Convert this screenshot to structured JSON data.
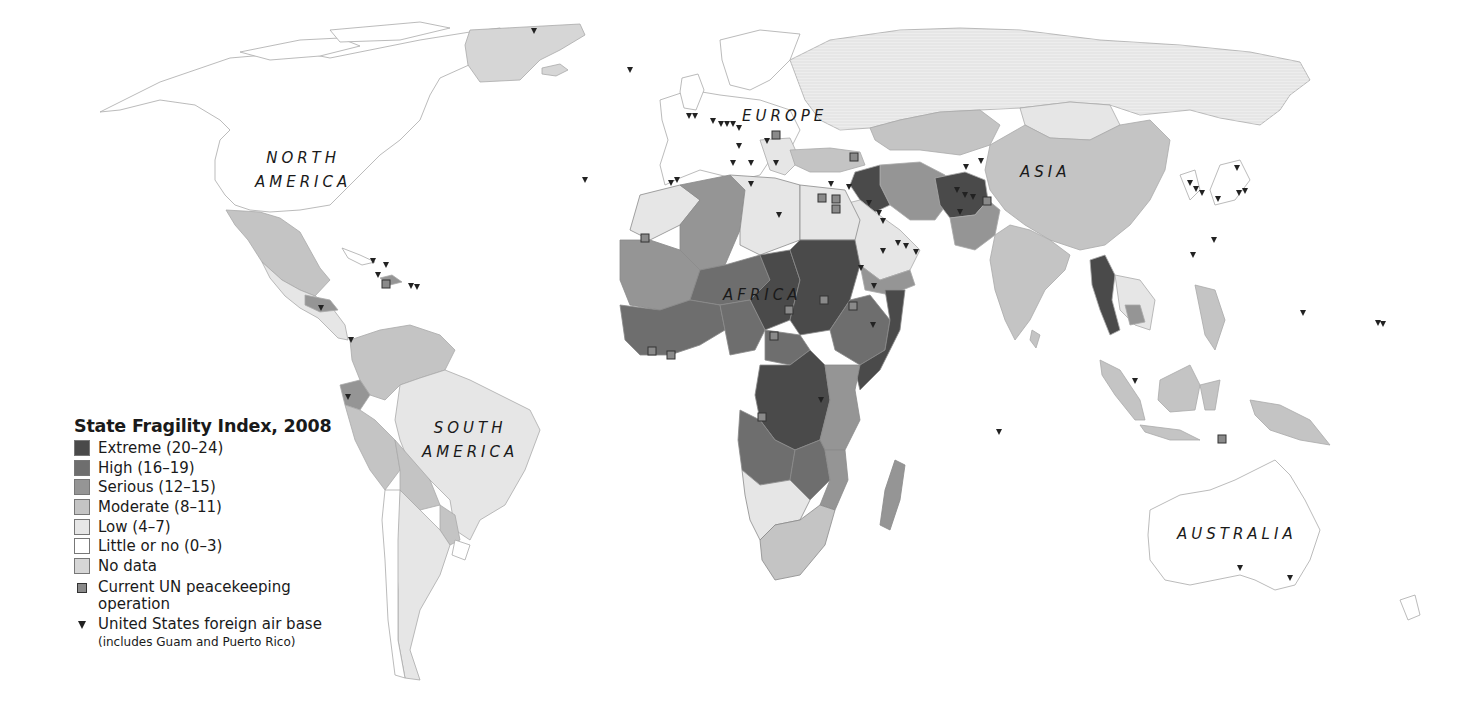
{
  "legend": {
    "title": "State Fragility Index, 2008",
    "categories": [
      {
        "label": "Extreme (20–24)",
        "color": "#4a4a4a"
      },
      {
        "label": "High (16–19)",
        "color": "#6e6e6e"
      },
      {
        "label": "Serious (12–15)",
        "color": "#959595"
      },
      {
        "label": "Moderate (8–11)",
        "color": "#c4c4c4"
      },
      {
        "label": "Low (4–7)",
        "color": "#e6e6e6"
      },
      {
        "label": "Little or no (0–3)",
        "color": "#ffffff"
      },
      {
        "label": "No data",
        "color": "#d6d6d6"
      }
    ],
    "symbols": {
      "un_peacekeeping": {
        "label": "Current UN peacekeeping",
        "label2": "operation"
      },
      "us_air_base": {
        "label": "United States foreign air base",
        "note": "(includes Guam and Puerto Rico)"
      }
    }
  },
  "continents": {
    "north_america": {
      "line1": "NORTH",
      "line2": "AMERICA"
    },
    "south_america": {
      "line1": "SOUTH",
      "line2": "AMERICA"
    },
    "europe": "EUROPE",
    "africa": "AFRICA",
    "asia": "ASIA",
    "australia": "AUSTRALIA"
  }
}
